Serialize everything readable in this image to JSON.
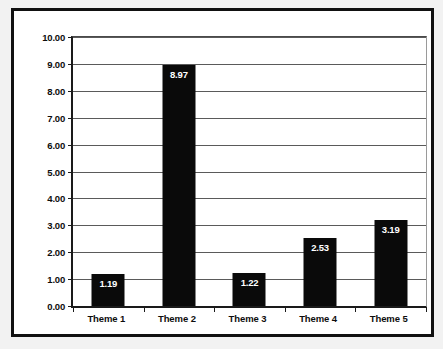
{
  "chart_data": {
    "type": "bar",
    "title": "",
    "subtitle": "",
    "xlabel": "",
    "ylabel": "",
    "categories": [
      "Theme 1",
      "Theme 2",
      "Theme 3",
      "Theme 4",
      "Theme 5"
    ],
    "values": [
      1.19,
      8.97,
      1.22,
      2.53,
      3.19
    ],
    "data_labels": [
      "1.19",
      "8.97",
      "1.22",
      "2.53",
      "3.19"
    ],
    "ylim": [
      0,
      10
    ],
    "ytick_step": 1,
    "ytick_labels": [
      "10.00",
      "9.00",
      "8.00",
      "7.00",
      "6.00",
      "5.00",
      "4.00",
      "3.00",
      "2.00",
      "1.00",
      "0.00"
    ],
    "ytick_values": [
      10,
      9,
      8,
      7,
      6,
      5,
      4,
      3,
      2,
      1,
      0
    ],
    "grid": true,
    "grid_axis": "y",
    "legend": false,
    "legend_position": "none",
    "bar_color": "#0a0a0a",
    "data_label_color": "#ffffff",
    "axis_color": "#1a1a1a",
    "grid_color": "#5a5a5a",
    "plot_background": "#ffffff",
    "frame_color": "#111111"
  }
}
